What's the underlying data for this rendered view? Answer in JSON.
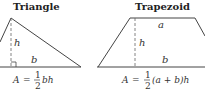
{
  "triangle": {
    "title": "Triangle",
    "labels": {
      "height": "h",
      "base": "b"
    },
    "formula": {
      "lhs": "A",
      "eq": "=",
      "num": "1",
      "den": "2",
      "rest": "bh"
    }
  },
  "trapezoid": {
    "title": "Trapezoid",
    "labels": {
      "height": "h",
      "top": "a",
      "base": "b"
    },
    "formula": {
      "lhs": "A",
      "eq": "=",
      "num": "1",
      "den": "2",
      "rest": "(a + b)h"
    }
  },
  "colors": {
    "stroke": "#444444",
    "text": "#333333"
  }
}
